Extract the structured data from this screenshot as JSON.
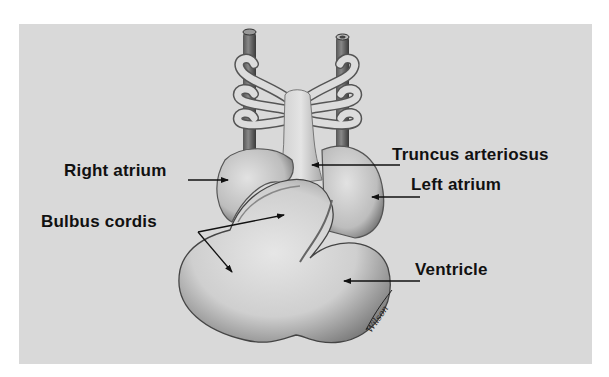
{
  "figure": {
    "background_color": "#d9d9d9",
    "page_color": "#ffffff",
    "ink_color": "#111111",
    "labels": [
      {
        "id": "truncus-arteriosus",
        "text": "Truncus arteriosus"
      },
      {
        "id": "right-atrium",
        "text": "Right atrium"
      },
      {
        "id": "left-atrium",
        "text": "Left atrium"
      },
      {
        "id": "bulbus-cordis",
        "text": "Bulbus cordis"
      },
      {
        "id": "ventricle",
        "text": "Ventricle"
      }
    ],
    "artist_signature": "Wilson"
  }
}
